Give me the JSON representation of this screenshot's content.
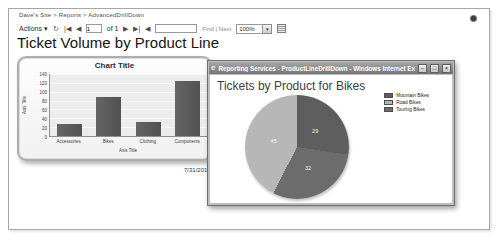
{
  "page": {
    "breadcrumb": "Dave's Site > Reports > AdvancedDrillDown",
    "title": "Ticket Volume by Product Line",
    "timestamp_partial": "7/31/2012 1:4"
  },
  "toolbar": {
    "actions_label": "Actions",
    "page_number": "1",
    "of_pages_label": "of 1",
    "find_placeholder": "",
    "find_label": "Find",
    "separator": "|",
    "next_label": "Next",
    "zoom_value": "100%"
  },
  "icons": {
    "caret_down": "▾",
    "refresh": "↻",
    "first_page": "|◀",
    "prev_page": "◀",
    "next_page": "▶",
    "last_page": "▶|",
    "back_to_parent": "◀",
    "ie_logo": "e",
    "minimize": "–",
    "maximize": "□",
    "close": "×"
  },
  "popup": {
    "window_title": "Reporting Services - ProductLineDrillDown - Windows Internet Explorer",
    "heading": "Tickets by Product for Bikes"
  },
  "colors": {
    "bar_fill": "#575757",
    "plot_background": "#ececec",
    "titlebar_text": "#ffffff"
  },
  "chart_data": [
    {
      "type": "bar",
      "title": "Chart Title",
      "xlabel": "Axis Title",
      "ylabel": "Axis Title",
      "categories": [
        "Accessories",
        "Bikes",
        "Clothing",
        "Components"
      ],
      "values": [
        28,
        88,
        31,
        124
      ],
      "ylim": [
        0,
        140
      ],
      "ytick_step": 20,
      "grid": true,
      "legend_position": "none"
    },
    {
      "type": "pie",
      "title": "Tickets by Product for Bikes",
      "slices": [
        {
          "label": "Mountain Bikes",
          "value": 29,
          "color": "#5e5e5e"
        },
        {
          "label": "Road Bikes",
          "value": 45,
          "color": "#b7b7b7"
        },
        {
          "label": "Touring Bikes",
          "value": 32,
          "color": "#6c6c6c"
        }
      ],
      "clockwise_from_top": [
        "Mountain Bikes",
        "Touring Bikes",
        "Road Bikes"
      ],
      "legend_position": "right",
      "labels_shown": "values"
    }
  ]
}
